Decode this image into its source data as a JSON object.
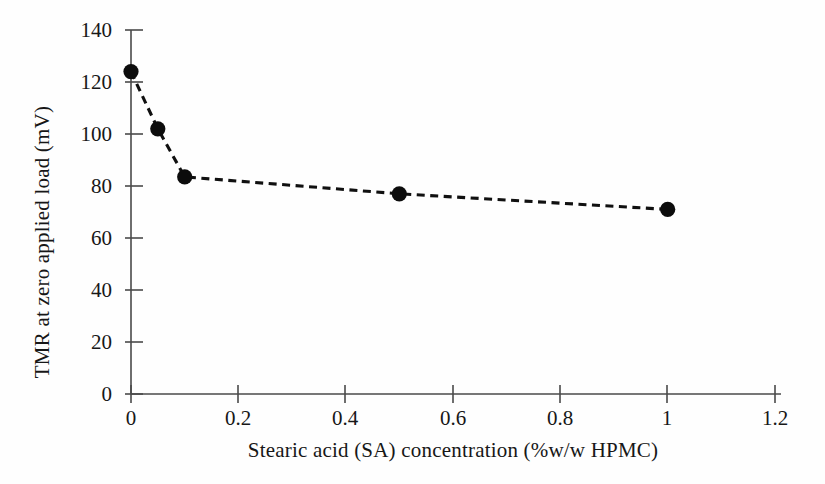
{
  "chart_data": {
    "type": "line",
    "title": "",
    "subtitle": "",
    "xlabel": "Stearic acid (SA) concentration (%w/w HPMC)",
    "ylabel": "TMR at zero applied load (mV)",
    "xlim": [
      0,
      1.2
    ],
    "ylim": [
      0,
      140
    ],
    "xticks": [
      0,
      0.2,
      0.4,
      0.6,
      0.8,
      1,
      1.2
    ],
    "xticklabels": [
      "0",
      "0.2",
      "0.4",
      "0.6",
      "0.8",
      "1",
      "1.2"
    ],
    "yticks": [
      0,
      20,
      40,
      60,
      80,
      100,
      120,
      140
    ],
    "yticklabels": [
      "0",
      "20",
      "40",
      "60",
      "80",
      "100",
      "120",
      "140"
    ],
    "grid": false,
    "legend": null,
    "annotations": [],
    "series": [
      {
        "name": "TMR at zero applied load",
        "marker": "filled-circle",
        "linestyle": "dashed",
        "color": "#0c0c0c",
        "x": [
          0,
          0.05,
          0.1,
          0.5,
          1
        ],
        "values": [
          124,
          102,
          83.5,
          77,
          71
        ]
      }
    ]
  },
  "figure": {
    "background_color": "#ffffff",
    "ink_color": "#171717",
    "axis_color": "#4a4a4a"
  }
}
